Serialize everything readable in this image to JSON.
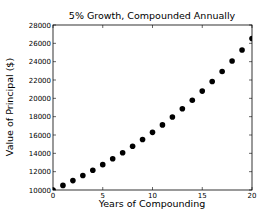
{
  "chart_data": {
    "type": "scatter",
    "title": "5% Growth, Compounded Annually",
    "xlabel": "Years of Compounding",
    "ylabel": "Value of Principal ($)",
    "xlim": [
      0,
      20
    ],
    "ylim": [
      10000,
      28000
    ],
    "xticks": [
      0,
      5,
      10,
      15,
      20
    ],
    "yticks": [
      10000,
      12000,
      14000,
      16000,
      18000,
      20000,
      22000,
      24000,
      26000,
      28000
    ],
    "grid": false,
    "legend": null,
    "marker_color": "#000000",
    "series": [
      {
        "name": "Principal",
        "x": [
          0,
          1,
          2,
          3,
          4,
          5,
          6,
          7,
          8,
          9,
          10,
          11,
          12,
          13,
          14,
          15,
          16,
          17,
          18,
          19,
          20
        ],
        "values": [
          10000,
          10500,
          11025,
          11576,
          12155,
          12763,
          13401,
          14071,
          14775,
          15513,
          16289,
          17103,
          17959,
          18856,
          19799,
          20789,
          21829,
          22920,
          24066,
          25270,
          26533
        ]
      }
    ]
  },
  "layout": {
    "plot": {
      "left": 53,
      "top": 25,
      "right": 252,
      "bottom": 190
    }
  }
}
